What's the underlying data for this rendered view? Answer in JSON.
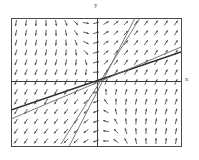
{
  "figure": {
    "kind": "direction-field-plot",
    "background": "#ffffff",
    "frame_color": "#4a4a4a",
    "axis_color": "#3a3a3a",
    "arrow_color": "#4d4d4d",
    "line_color": "#6a6a6a",
    "bold_line_color": "#2b2b2b"
  },
  "axes": {
    "y_label": "y",
    "x_label": "x",
    "origin": {
      "x": 97,
      "y": 81
    },
    "frame": {
      "left": 11,
      "top": 18,
      "right": 181,
      "bottom": 146
    }
  },
  "chart_data": {
    "type": "scatter",
    "title": "",
    "xlabel": "x",
    "ylabel": "y",
    "grid": false,
    "legend": null,
    "xlim": [
      -4,
      4
    ],
    "ylim": [
      -3,
      3
    ],
    "field": {
      "description": "slope field of arrows on a regular grid",
      "cols": 17,
      "rows": 13,
      "arrow_length": 6,
      "default_direction_deg": 35
    },
    "annotations": [
      {
        "text": "y",
        "position": "top-center"
      },
      {
        "text": "x",
        "position": "right-middle"
      }
    ],
    "series": [
      {
        "name": "steep-line-a",
        "style": "thin",
        "points": [
          [
            -60,
            -128
          ],
          [
            38,
            63
          ]
        ]
      },
      {
        "name": "steep-line-b",
        "style": "thin",
        "points": [
          [
            -36,
            -63
          ],
          [
            43,
            63
          ]
        ]
      },
      {
        "name": "shallow-line",
        "style": "bold",
        "points": [
          [
            -86,
            -29
          ],
          [
            84,
            29
          ]
        ]
      },
      {
        "name": "shallow-line-2",
        "style": "thin",
        "points": [
          [
            -86,
            -38
          ],
          [
            84,
            34
          ]
        ]
      }
    ]
  }
}
